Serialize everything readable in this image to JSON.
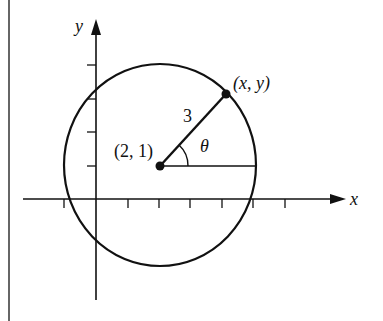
{
  "diagram": {
    "axes": {
      "x_label": "x",
      "y_label": "y",
      "x_ticks": [
        -1,
        1,
        2,
        3,
        4,
        5,
        6
      ],
      "y_ticks": [
        1,
        2,
        3,
        4
      ]
    },
    "circle": {
      "center": [
        2,
        1
      ],
      "radius": 3
    },
    "labels": {
      "center": "(2, 1)",
      "point": "(x, y)",
      "radius": "3",
      "angle": "θ"
    },
    "colors": {
      "stroke": "#111111",
      "background": "#ffffff"
    }
  }
}
